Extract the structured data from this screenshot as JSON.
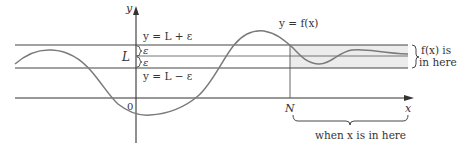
{
  "figure": {
    "type": "limit-at-infinity-illustration",
    "colors": {
      "axis": "#333333",
      "curve": "#7a7a7a",
      "band_lines": "#444444",
      "shade": "#ececec",
      "text": "#333333"
    },
    "labels": {
      "y_axis": "y",
      "x_axis": "x",
      "origin": "0",
      "L": "L",
      "N": "N",
      "upper_line": "y = L + ε",
      "lower_line": "y = L − ε",
      "epsilon_upper": "ε",
      "epsilon_lower": "ε",
      "curve_label": "y = f(x)",
      "right_brace_line1": "f(x) is",
      "right_brace_line2": "in here",
      "bottom_brace": "when x is in here"
    }
  }
}
